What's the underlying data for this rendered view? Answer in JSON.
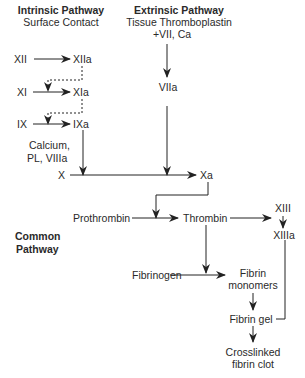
{
  "headers": {
    "intrinsic": {
      "title": "Intrinsic Pathway",
      "subtitle": "Surface Contact"
    },
    "extrinsic": {
      "title": "Extrinsic Pathway",
      "subtitle": "Tissue Thromboplastin",
      "subtitle2": "+VII, Ca"
    },
    "common": {
      "line1": "Common",
      "line2": "Pathway"
    }
  },
  "nodes": {
    "xii": "XII",
    "xiia": "XIIa",
    "xi": "XI",
    "xia": "XIa",
    "ix": "IX",
    "ixa": "IXa",
    "cofactors1": "Calcium,",
    "cofactors2": "PL, VIIIa",
    "viia": "VIIa",
    "x": "X",
    "xa": "Xa",
    "prothrombin": "Prothrombin",
    "thrombin": "Thrombin",
    "xiii": "XIII",
    "xiiia": "XIIIa",
    "fibrinogen": "Fibrinogen",
    "fibrin_monomers1": "Fibrin",
    "fibrin_monomers2": "monomers",
    "fibrin_gel": "Fibrin gel",
    "clot1": "Crosslinked",
    "clot2": "fibrin clot"
  },
  "colors": {
    "line": "#222222",
    "text": "#2a2a2a"
  }
}
